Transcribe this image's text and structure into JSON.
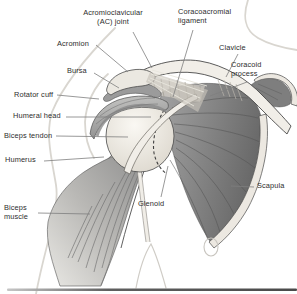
{
  "figure": {
    "labels": {
      "ac_joint": "Acromioclavicular\n(AC) joint",
      "coracoacromial_ligament": "Coracoacromial\nligament",
      "acromion": "Acromion",
      "clavicle": "Clavicle",
      "coracoid_process": "Coracoid\nprocess",
      "bursa": "Bursa",
      "rotator_cuff": "Rotator cuff",
      "humeral_head": "Humeral head",
      "biceps_tendon": "Biceps tendon",
      "humerus": "Humerus",
      "biceps_muscle": "Biceps\nmuscle",
      "glenoid": "Glenoid",
      "scapula": "Scapula"
    },
    "palette": {
      "background": "#ffffff",
      "outline": "#4a4a4a",
      "bone_light": "#efece6",
      "muscle_dark": "#6b6b6b",
      "muscle_mid": "#9b9b9b",
      "body_contour": "#d9d6d0",
      "label_text": "#2d2d2d",
      "pointer_line": "#7f7f7f"
    }
  }
}
